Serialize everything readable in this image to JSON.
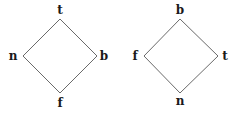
{
  "diagrams": [
    {
      "name": "left-lattice",
      "nodes": {
        "top": {
          "label": "t",
          "x": 60,
          "y": 19,
          "lx": 60,
          "ly": 14
        },
        "left": {
          "label": "n",
          "x": 23,
          "y": 56,
          "lx": 13,
          "ly": 60
        },
        "right": {
          "label": "b",
          "x": 97,
          "y": 56,
          "lx": 104,
          "ly": 60
        },
        "bottom": {
          "label": "f",
          "x": 60,
          "y": 93,
          "lx": 60,
          "ly": 107
        }
      },
      "edges": [
        [
          "top",
          "left"
        ],
        [
          "top",
          "right"
        ],
        [
          "left",
          "bottom"
        ],
        [
          "right",
          "bottom"
        ]
      ]
    },
    {
      "name": "right-lattice",
      "nodes": {
        "top": {
          "label": "b",
          "x": 180,
          "y": 19,
          "lx": 180,
          "ly": 14
        },
        "left": {
          "label": "f",
          "x": 144,
          "y": 56,
          "lx": 135,
          "ly": 60
        },
        "right": {
          "label": "t",
          "x": 218,
          "y": 56,
          "lx": 225,
          "ly": 60
        },
        "bottom": {
          "label": "n",
          "x": 180,
          "y": 93,
          "lx": 180,
          "ly": 105
        }
      },
      "edges": [
        [
          "top",
          "left"
        ],
        [
          "top",
          "right"
        ],
        [
          "left",
          "bottom"
        ],
        [
          "right",
          "bottom"
        ]
      ]
    }
  ],
  "colors": {
    "edge": "#6a6a6a",
    "label": "#1a1a1a",
    "background": "#ffffff"
  }
}
